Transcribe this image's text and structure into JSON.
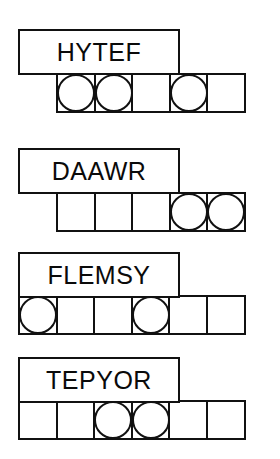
{
  "worksheet": {
    "title": "Word Unscramble Worksheet",
    "cell_size": 40,
    "rows": [
      {
        "id": "row-1",
        "word": "HYTEF",
        "label_left": 18,
        "label_top": 29,
        "label_width": 162,
        "label_height": 46,
        "grid_left": 56,
        "grid_top": 73,
        "cell_count": 5,
        "circles": [
          1,
          2,
          4
        ]
      },
      {
        "id": "row-2",
        "word": "DAAWR",
        "label_left": 18,
        "label_top": 148,
        "label_width": 162,
        "label_height": 46,
        "grid_left": 56,
        "grid_top": 192,
        "cell_count": 5,
        "circles": [
          4,
          5
        ]
      },
      {
        "id": "row-3",
        "word": "FLEMSY",
        "label_left": 18,
        "label_top": 252,
        "label_width": 162,
        "label_height": 46,
        "grid_left": 18,
        "grid_top": 295,
        "cell_count": 6,
        "circles": [
          1,
          4
        ]
      },
      {
        "id": "row-4",
        "word": "TEPYOR",
        "label_left": 18,
        "label_top": 357,
        "label_width": 162,
        "label_height": 46,
        "grid_left": 18,
        "grid_top": 400,
        "cell_count": 6,
        "circles": [
          3,
          4
        ]
      }
    ]
  },
  "colors": {
    "ink": "#111111",
    "paper": "#ffffff"
  }
}
